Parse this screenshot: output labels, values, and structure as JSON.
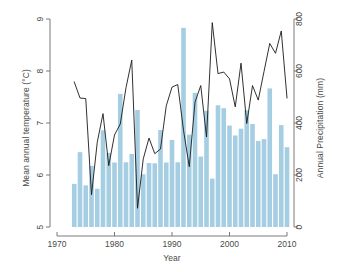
{
  "chart_data": {
    "type": "bar",
    "title": "",
    "xlabel": "Year",
    "ylabel": "Mean annual temperature (°C)",
    "ylabel_right": "Annual Precipitation (mm)",
    "x": [
      1973,
      1974,
      1975,
      1976,
      1977,
      1978,
      1979,
      1980,
      1981,
      1982,
      1983,
      1984,
      1985,
      1986,
      1987,
      1988,
      1989,
      1990,
      1991,
      1992,
      1993,
      1994,
      1995,
      1996,
      1997,
      1998,
      1999,
      2000,
      2001,
      2002,
      2003,
      2004,
      2005,
      2006,
      2007,
      2008,
      2009,
      2010
    ],
    "xlim": [
      1970,
      2011
    ],
    "xticks": [
      1970,
      1980,
      1990,
      2000,
      2010
    ],
    "xticklabels": [
      "1970",
      "1980",
      "1990",
      "2000",
      "2010"
    ],
    "ylim": [
      5,
      9
    ],
    "yticks": [
      5,
      6,
      7,
      8,
      9
    ],
    "yticklabels": [
      "5",
      "6",
      "7",
      "8",
      "9"
    ],
    "ylim_right": [
      0,
      800
    ],
    "yticks_right": [
      0,
      200,
      400,
      600,
      800
    ],
    "yticklabels_right": [
      "0",
      "200",
      "400",
      "600",
      "800"
    ],
    "grid": false,
    "legend": "none",
    "series": [
      {
        "name": "Annual Precipitation (mm)",
        "type": "bar",
        "axis": "right",
        "units": "mm",
        "color": "#a6cee3",
        "values": [
          166,
          288,
          160,
          235,
          147,
          372,
          285,
          248,
          512,
          249,
          281,
          450,
          203,
          246,
          245,
          373,
          248,
          335,
          249,
          766,
          355,
          516,
          271,
          447,
          186,
          468,
          457,
          390,
          352,
          378,
          449,
          396,
          331,
          338,
          533,
          203,
          392,
          307
        ]
      },
      {
        "name": "Mean annual temperature (°C)",
        "type": "line",
        "axis": "left",
        "units": "°C",
        "color": "#1a1a1a",
        "values": [
          7.79,
          7.48,
          7.47,
          5.62,
          6.63,
          7.18,
          6.18,
          6.77,
          6.98,
          7.68,
          8.21,
          5.36,
          6.31,
          6.71,
          6.41,
          6.5,
          7.33,
          7.69,
          7.74,
          6.86,
          6.16,
          7.4,
          7.72,
          6.73,
          8.93,
          7.95,
          7.98,
          7.85,
          7.31,
          8.15,
          6.99,
          7.72,
          7.44,
          7.99,
          8.53,
          8.34,
          8.77,
          7.48
        ]
      }
    ]
  }
}
